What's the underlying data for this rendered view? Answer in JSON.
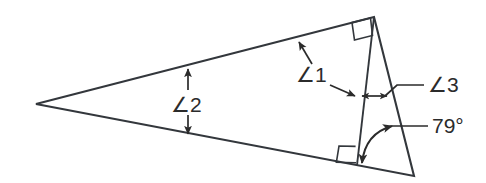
{
  "figure": {
    "type": "geometry-diagram",
    "background_color": "#ffffff",
    "line_color": "#33373c",
    "label_color": "#2b2b2b",
    "vertices": {
      "left": {
        "name": "left-vertex",
        "x": 36,
        "y": 104
      },
      "apex": {
        "name": "top-right-apex",
        "x": 374,
        "y": 17
      },
      "bottom_right": {
        "name": "bottom-right-vertex",
        "x": 414,
        "y": 176
      },
      "cevian_foot": {
        "name": "cevian-foot",
        "x": 357,
        "y": 165
      }
    },
    "edges": [
      {
        "name": "top-edge",
        "from": "left",
        "to": "apex"
      },
      {
        "name": "bottom-edge",
        "from": "left",
        "to": "bottom_right"
      },
      {
        "name": "right-edge",
        "from": "apex",
        "to": "bottom_right"
      },
      {
        "name": "cevian-edge",
        "from": "apex",
        "to": "cevian_foot"
      }
    ],
    "right_angles": [
      {
        "name": "right-angle-apex",
        "at": "apex",
        "between": [
          "top-edge",
          "cevian-edge"
        ]
      },
      {
        "name": "right-angle-cevian-foot",
        "at": "cevian_foot",
        "between": [
          "bottom-edge",
          "cevian-edge"
        ]
      }
    ],
    "labels": [
      {
        "id": "angle1",
        "name": "angle-1-label",
        "text": "∠1",
        "x": 296,
        "y": 82,
        "points_to": [
          "top-edge",
          "cevian-edge"
        ],
        "note": "leader arrows point up-left to the top edge and right to the cevian"
      },
      {
        "id": "angle2",
        "name": "angle-2-label",
        "text": "∠2",
        "x": 171,
        "y": 112,
        "points_to": [
          "top-edge",
          "bottom-edge"
        ],
        "note": "double-headed vertical arrow spanning between top and bottom edges"
      },
      {
        "id": "angle3",
        "name": "angle-3-label",
        "text": "∠3",
        "x": 428,
        "y": 92,
        "points_to": [
          "cevian-edge",
          "right-edge"
        ],
        "note": "leader line to a double-headed horizontal arrow between cevian and right edge"
      },
      {
        "id": "angle79",
        "name": "angle-79-degree-label",
        "text": "79°",
        "x": 432,
        "y": 133,
        "points_to": [
          "bottom-right-vertex"
        ],
        "note": "leader line to a curved double-headed arc at the bottom-right interior angle"
      }
    ],
    "angle_values": {
      "angle_1": "∠1",
      "angle_2": "∠2",
      "angle_3": "∠3",
      "given_angle": "79°"
    }
  }
}
